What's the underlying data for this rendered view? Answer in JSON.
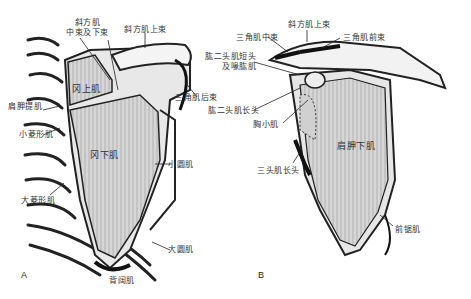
{
  "panels": {
    "A": {
      "letter": "A",
      "labels": {
        "trapezius_mid_lower": [
          "斜方肌",
          "中束及下束"
        ],
        "trapezius_upper": "斜方肌上束",
        "supraspinatus": "冈上肌",
        "deltoid_posterior": "三角肌后束",
        "levator_scapulae": "肩胛提肌",
        "rhomboid_minor": "小菱形肌",
        "infraspinatus": "冈下肌",
        "teres_minor": "小圆肌",
        "rhomboid_major": "大菱形肌",
        "teres_major": "大圆肌",
        "latissimus_dorsi": "背阔肌"
      }
    },
    "B": {
      "letter": "B",
      "labels": {
        "trapezius_upper": "斜方肌上束",
        "deltoid_middle": "三角肌中束",
        "deltoid_anterior": "三角肌前束",
        "biceps_short_coracobrachialis": [
          "肱二头肌短头",
          "及喙肱肌"
        ],
        "biceps_long": "肱二头肌长头",
        "pectoralis_minor": "胸小肌",
        "subscapularis": "肩胛下肌",
        "triceps_long": "三头肌长头",
        "serratus_anterior": "前锯肌"
      }
    }
  }
}
